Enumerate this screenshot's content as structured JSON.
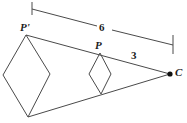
{
  "figure": {
    "background_color": "#ffffff",
    "stroke_color": "#4a4a4a",
    "label_color": "#1c1c1c",
    "labels": {
      "preimage_vertex": "P'",
      "image_vertex": "P",
      "center": "C",
      "outer_measure": "6",
      "inner_measure": "3"
    },
    "points": {
      "P_prime": {
        "x": 26,
        "y": 35
      },
      "P": {
        "x": 100,
        "y": 53
      },
      "C": {
        "x": 170,
        "y": 74
      },
      "large_rhombus_left": {
        "x": 3,
        "y": 75
      },
      "large_rhombus_right": {
        "x": 50,
        "y": 74
      },
      "large_rhombus_bottom": {
        "x": 28,
        "y": 117
      },
      "small_rhombus_left": {
        "x": 89,
        "y": 74
      },
      "small_rhombus_right": {
        "x": 111,
        "y": 74
      },
      "small_rhombus_bottom": {
        "x": 101,
        "y": 94
      }
    },
    "measure_bar": {
      "left_tick": {
        "x": 32,
        "y_top": 2,
        "y_bottom": 15
      },
      "right_tick": {
        "x": 173,
        "y_top": 35,
        "y_bottom": 54
      },
      "line_start": {
        "x": 32,
        "y": 9
      },
      "line_end": {
        "x": 173,
        "y": 45
      }
    },
    "label_positions": {
      "P_prime": {
        "left": 20,
        "top": 22
      },
      "P": {
        "left": 95,
        "top": 40
      },
      "C": {
        "left": 175,
        "top": 68
      },
      "six": {
        "left": 99,
        "top": 23
      },
      "three": {
        "left": 131,
        "top": 51
      }
    }
  }
}
